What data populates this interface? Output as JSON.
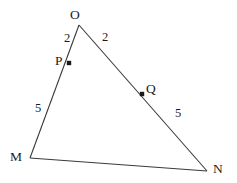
{
  "figure": {
    "background_color": "#ffffff",
    "stroke_color": "#3a3a3a",
    "text_color": "#1c1c1c",
    "point_color": "#1a1a1a",
    "vertices": {
      "O": {
        "label": "O",
        "x": 79,
        "y": 25
      },
      "M": {
        "label": "M",
        "x": 30,
        "y": 158
      },
      "N": {
        "label": "N",
        "x": 207,
        "y": 171
      }
    },
    "points": {
      "P": {
        "label": "P",
        "x": 69,
        "y": 63,
        "on_segment": "OM"
      },
      "Q": {
        "label": "Q",
        "x": 142,
        "y": 94,
        "on_segment": "ON"
      }
    },
    "segment_labels": {
      "OP": "2",
      "OQ": "2",
      "PM": "5",
      "QN": "5"
    }
  }
}
